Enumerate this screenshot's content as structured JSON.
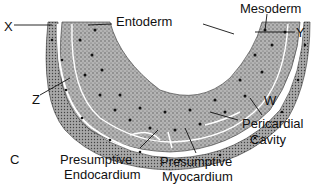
{
  "figure": {
    "panel_letter": "C",
    "labels": {
      "entoderm": "Entoderm",
      "mesoderm": "Mesoderm",
      "x": "X",
      "y": "Y",
      "z": "Z",
      "w": "W",
      "pericardial_line1": "Pericardial",
      "pericardial_line2": "Cavity",
      "endo_line1": "Presumptive",
      "endo_line2": "Endocardium",
      "myo_line1": "Presumptive",
      "myo_line2": "Myocardium"
    },
    "colors": {
      "tissue_fill": "#9a9a9a",
      "tissue_dark": "#555555",
      "nuclei": "#1a1a1a",
      "outline": "#222222",
      "background": "#ffffff"
    }
  }
}
